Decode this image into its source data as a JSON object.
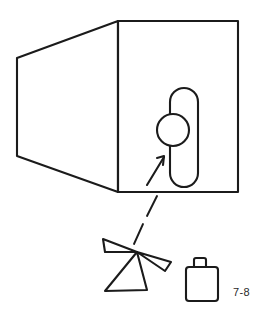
{
  "figure": {
    "caption": "7-8",
    "stroke_color": "#1b1b1b",
    "background_color": "#ffffff"
  },
  "container": {
    "name": "tapered box body",
    "right_face": {
      "name": "front rectangular face",
      "x": 118,
      "y": 21,
      "width": 120,
      "height": 171
    },
    "left_face": {
      "name": "tapered side face",
      "points": "118,21 17,58 17,156 118,192"
    },
    "top_edge": {
      "from_x": 17,
      "from_y": 58,
      "to_x": 118,
      "to_y": 21
    },
    "bottom_edge": {
      "from_x": 17,
      "from_y": 156,
      "to_x": 118,
      "to_y": 192
    }
  },
  "port_detail": {
    "slot": {
      "name": "vertical rounded slot",
      "x": 170,
      "y": 88,
      "width": 28,
      "height": 99,
      "corner_radius": 14
    },
    "circle": {
      "name": "circular access port",
      "center_x": 173,
      "center_y": 130,
      "radius": 16
    },
    "arrow": {
      "name": "callout arrow pointing to port",
      "tail_x": 148,
      "tail_y": 184,
      "head_x": 164,
      "head_y": 157
    }
  },
  "leader_line": {
    "name": "dashed leader line",
    "dashes": [
      {
        "x1": 156,
        "y1": 196,
        "x2": 147,
        "y2": 214
      },
      {
        "x1": 143,
        "y1": 223,
        "x2": 134,
        "y2": 243
      }
    ]
  },
  "fragments": {
    "name": "scattered triangular fragments",
    "apex_x": 137,
    "apex_y": 252,
    "pieces": [
      {
        "label": "upper left wedge",
        "points": "137,252 104,240 106,251"
      },
      {
        "label": "right wedge",
        "points": "137,252 170,262 166,270"
      },
      {
        "label": "lower large triangle",
        "points": "137,252 106,291 146,289"
      }
    ]
  },
  "bag": {
    "name": "bag container",
    "body": {
      "x": 186,
      "y": 268,
      "width": 32,
      "height": 33,
      "corner_radius": 3
    },
    "handle": {
      "x": 194,
      "y": 258,
      "width": 11,
      "height": 11
    }
  }
}
